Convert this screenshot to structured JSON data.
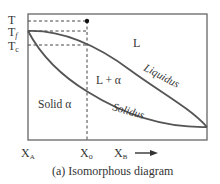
{
  "diagram": {
    "title": "Isomorphous diagram",
    "caption": "(a) Isomorphous diagram",
    "y_axis_labels": {
      "T": "T",
      "Tf_main": "T",
      "Tf_sub": "f",
      "Tc_main": "T",
      "Tc_sub": "c"
    },
    "x_axis_labels": {
      "XA_main": "X",
      "XA_sub": "A",
      "Xo_main": "X",
      "Xo_sub": "o",
      "XB_main": "X",
      "XB_sub": "B"
    },
    "regions": {
      "liquid": "L",
      "two_phase": "L + α",
      "solid": "Solid α"
    },
    "curves": {
      "liquidus": "Liquidus",
      "solidus": "Solidus"
    },
    "colors": {
      "line": "#555555",
      "curve": "#555555",
      "text": "#333333",
      "dot": "#111111"
    }
  }
}
